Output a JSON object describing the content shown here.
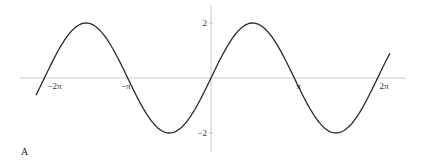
{
  "panel_label": "A",
  "chart_data": {
    "type": "line",
    "title": "",
    "function": "y = 2 sin(x)",
    "xlabel": "",
    "ylabel": "",
    "xlim": [
      -6.6,
      7.0
    ],
    "ylim": [
      -2.4,
      2.4
    ],
    "x_domain": [
      -6.6,
      6.75
    ],
    "grid": false,
    "legend": null,
    "x_ticks": [
      {
        "value": -6.2832,
        "label": "−2π"
      },
      {
        "value": -3.1416,
        "label": "−π"
      },
      {
        "value": 3.1416,
        "label": "π"
      },
      {
        "value": 6.2832,
        "label": "2π"
      }
    ],
    "y_ticks": [
      {
        "value": 2,
        "label": "2"
      },
      {
        "value": -2,
        "label": "−2"
      }
    ],
    "series": [
      {
        "name": "2 sin(x)",
        "color": "#2a2a2a",
        "x": [
          -6.2832,
          -4.7124,
          -3.1416,
          -1.5708,
          0,
          1.5708,
          3.1416,
          4.7124,
          6.2832
        ],
        "values": [
          0,
          2,
          0,
          -2,
          0,
          2,
          0,
          -2,
          0
        ]
      }
    ]
  },
  "colors": {
    "axis": "#c8c8c8",
    "curve": "#2a2a2a",
    "text": "#333333"
  }
}
